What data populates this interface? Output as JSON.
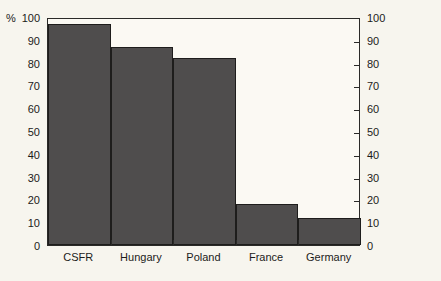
{
  "chart_data": {
    "type": "bar",
    "title": "",
    "xlabel": "",
    "ylabel": "%",
    "unit_symbol": "%",
    "categories": [
      "CSFR",
      "Hungary",
      "Poland",
      "France",
      "Germany"
    ],
    "values": [
      97,
      87,
      82,
      18,
      12
    ],
    "ylim": [
      0,
      100
    ],
    "y_ticks": [
      0,
      10,
      20,
      30,
      40,
      50,
      60,
      70,
      80,
      90,
      100
    ],
    "y_tick_labels_left": [
      "0",
      "10",
      "20",
      "30",
      "40",
      "50",
      "60",
      "70",
      "80",
      "90",
      "100"
    ],
    "y_tick_labels_right": [
      "0",
      "10",
      "20",
      "30",
      "40",
      "50",
      "60",
      "70",
      "80",
      "90",
      "100"
    ],
    "right_axis": true,
    "grid": false,
    "legend": false,
    "bar_color": "#4f4d4d",
    "bar_edge_color": "#1e1d1c",
    "background_color": "#f7f5ee",
    "plot_background_color": "#fbf9f3",
    "axis_color": "#2b2a28"
  }
}
